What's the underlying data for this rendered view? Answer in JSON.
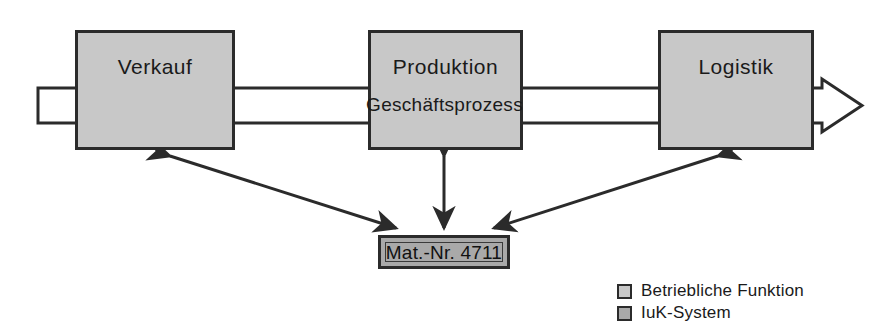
{
  "diagram": {
    "title_text": "Geschäftsprozess",
    "process_bar": {
      "label": "Geschäftsprozess",
      "fill_color": "#ffffff",
      "stroke_color": "#2b2b2b",
      "direction": "left-to-right"
    },
    "function_boxes": [
      {
        "id": "verkauf",
        "label": "Verkauf",
        "fill_color": "#c8c8c8",
        "stroke_color": "#2b2b2b",
        "x": 75,
        "y": 30,
        "w": 160,
        "h": 120
      },
      {
        "id": "produktion",
        "label": "Produktion",
        "fill_color": "#c8c8c8",
        "stroke_color": "#2b2b2b",
        "x": 368,
        "y": 30,
        "w": 155,
        "h": 120
      },
      {
        "id": "logistik",
        "label": "Logistik",
        "fill_color": "#c8c8c8",
        "stroke_color": "#2b2b2b",
        "x": 658,
        "y": 30,
        "w": 156,
        "h": 120
      }
    ],
    "system_box": {
      "id": "mat-nr-4711",
      "label": "Mat.-Nr. 4711",
      "fill_color": "#a9a9a9",
      "stroke_color": "#2b2b2b",
      "x": 378,
      "y": 235,
      "w": 132,
      "h": 34
    },
    "connectors": [
      {
        "id": "verkauf-to-system",
        "from": "verkauf",
        "to": "mat-nr-4711",
        "arrowheads": "both"
      },
      {
        "id": "produktion-to-system",
        "from": "produktion",
        "to": "mat-nr-4711",
        "arrowheads": "both"
      },
      {
        "id": "logistik-to-system",
        "from": "logistik",
        "to": "mat-nr-4711",
        "arrowheads": "both"
      }
    ],
    "legend": {
      "items": [
        {
          "label": "Betriebliche Funktion",
          "swatch_color": "#c8c8c8"
        },
        {
          "label": "IuK-System",
          "swatch_color": "#a9a9a9"
        }
      ]
    }
  }
}
